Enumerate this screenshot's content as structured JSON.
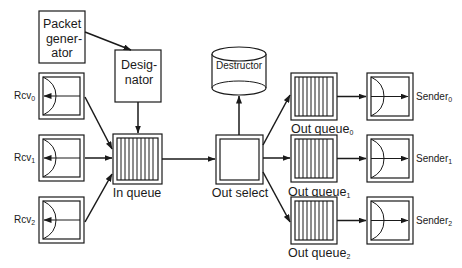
{
  "diagram": {
    "type": "packet-switch-architecture",
    "packet_generator": {
      "lines": [
        "Packet",
        "gener-",
        "ator"
      ]
    },
    "designator": {
      "lines": [
        "Desig-",
        "nator"
      ]
    },
    "destructor": {
      "label": "Destructor"
    },
    "in_queue": {
      "label": "In queue"
    },
    "out_select": {
      "label": "Out select"
    },
    "receivers": [
      {
        "base": "Rcv",
        "sub": "0"
      },
      {
        "base": "Rcv",
        "sub": "1"
      },
      {
        "base": "Rcv",
        "sub": "2"
      }
    ],
    "out_queues": [
      {
        "base": "Out queue",
        "sub": "0"
      },
      {
        "base": "Out queue",
        "sub": "1"
      },
      {
        "base": "Out queue",
        "sub": "2"
      }
    ],
    "senders": [
      {
        "base": "Sender",
        "sub": "0"
      },
      {
        "base": "Sender",
        "sub": "1"
      },
      {
        "base": "Sender",
        "sub": "2"
      }
    ],
    "edges": [
      [
        "Packet generator",
        "Designator"
      ],
      [
        "Designator",
        "In queue"
      ],
      [
        "Rcv0",
        "In queue"
      ],
      [
        "Rcv1",
        "In queue"
      ],
      [
        "Rcv2",
        "In queue"
      ],
      [
        "In queue",
        "Out select"
      ],
      [
        "Out select",
        "Destructor"
      ],
      [
        "Out select",
        "Out queue0"
      ],
      [
        "Out select",
        "Out queue1"
      ],
      [
        "Out select",
        "Out queue2"
      ],
      [
        "Out queue0",
        "Sender0"
      ],
      [
        "Out queue1",
        "Sender1"
      ],
      [
        "Out queue2",
        "Sender2"
      ]
    ]
  }
}
